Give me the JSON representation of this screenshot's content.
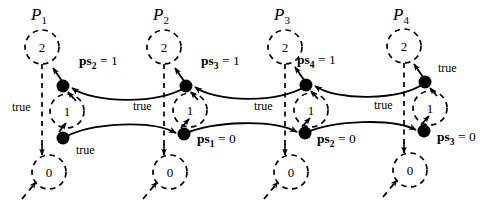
{
  "figure": {
    "kind": "timing-diagram",
    "background_color": "#ffffff",
    "ink_color": "#000000",
    "width": 487,
    "height": 205
  },
  "processes": [
    {
      "id": "p1",
      "name": "P",
      "index": "1",
      "axis_x": 42
    },
    {
      "id": "p2",
      "name": "P",
      "index": "2",
      "axis_x": 164
    },
    {
      "id": "p3",
      "name": "P",
      "index": "3",
      "axis_x": 285
    },
    {
      "id": "p4",
      "name": "P",
      "index": "4",
      "axis_x": 404
    }
  ],
  "states": {
    "top_value": "2",
    "mid_value": "1",
    "bottom_value": "0"
  },
  "state_circles": [
    {
      "id": "p1-state-2",
      "value": "2",
      "cx": 42,
      "cy": 47,
      "r": 17
    },
    {
      "id": "p1-state-1",
      "value": "1",
      "cx": 67,
      "cy": 111,
      "r": 17
    },
    {
      "id": "p1-state-0",
      "value": "0",
      "cx": 49,
      "cy": 172,
      "r": 17
    },
    {
      "id": "p2-state-2",
      "value": "2",
      "cx": 164,
      "cy": 47,
      "r": 17
    },
    {
      "id": "p2-state-1",
      "value": "1",
      "cx": 190,
      "cy": 110,
      "r": 17
    },
    {
      "id": "p2-state-0",
      "value": "0",
      "cx": 170,
      "cy": 172,
      "r": 17
    },
    {
      "id": "p3-state-2",
      "value": "2",
      "cx": 285,
      "cy": 47,
      "r": 17
    },
    {
      "id": "p3-state-1",
      "value": "1",
      "cx": 311,
      "cy": 110,
      "r": 17
    },
    {
      "id": "p3-state-0",
      "value": "0",
      "cx": 291,
      "cy": 172,
      "r": 17
    },
    {
      "id": "p4-state-2",
      "value": "2",
      "cx": 404,
      "cy": 46,
      "r": 17
    },
    {
      "id": "p4-state-1",
      "value": "1",
      "cx": 430,
      "cy": 108,
      "r": 17
    },
    {
      "id": "p4-state-0",
      "value": "0",
      "cx": 410,
      "cy": 170,
      "r": 17
    }
  ],
  "event_nodes": [
    {
      "id": "p1-upper",
      "cx": 63,
      "cy": 86,
      "r": 6.5
    },
    {
      "id": "p1-lower",
      "cx": 63,
      "cy": 138,
      "r": 6.5
    },
    {
      "id": "p2-upper",
      "cx": 186,
      "cy": 86,
      "r": 6.5
    },
    {
      "id": "p2-lower",
      "cx": 184,
      "cy": 134,
      "r": 6.5
    },
    {
      "id": "p3-upper",
      "cx": 306,
      "cy": 85,
      "r": 6.5
    },
    {
      "id": "p3-lower",
      "cx": 305,
      "cy": 133,
      "r": 6.5
    },
    {
      "id": "p4-upper",
      "cx": 425,
      "cy": 82,
      "r": 6.5
    },
    {
      "id": "p4-lower",
      "cx": 424,
      "cy": 131,
      "r": 6.5
    }
  ],
  "guards": [
    {
      "id": "guard-p1-axis",
      "text": "true",
      "x": 12,
      "y": 101
    },
    {
      "id": "guard-p1-lower",
      "text": "true",
      "x": 76,
      "y": 144
    },
    {
      "id": "guard-p2-axis",
      "text": "true",
      "x": 133,
      "y": 100
    },
    {
      "id": "guard-p3-axis",
      "text": "true",
      "x": 254,
      "y": 100
    },
    {
      "id": "guard-p4-axis",
      "text": "true",
      "x": 374,
      "y": 99
    },
    {
      "id": "guard-p4-upper",
      "text": "true",
      "x": 438,
      "y": 62
    }
  ],
  "ps_labels": [
    {
      "id": "ps2-eq-1",
      "symbol": "ps",
      "index": "2",
      "value": "1",
      "x": 79,
      "y": 61
    },
    {
      "id": "ps3-eq-1",
      "symbol": "ps",
      "index": "3",
      "value": "1",
      "x": 201,
      "y": 61
    },
    {
      "id": "ps4-eq-1",
      "symbol": "ps",
      "index": "4",
      "value": "1",
      "x": 297,
      "y": 60
    },
    {
      "id": "ps1-eq-0",
      "symbol": "ps",
      "index": "1",
      "value": "0",
      "x": 197,
      "y": 139
    },
    {
      "id": "ps2-eq-0",
      "symbol": "ps",
      "index": "2",
      "value": "0",
      "x": 317,
      "y": 139
    },
    {
      "id": "ps3-eq-0",
      "symbol": "ps",
      "index": "3",
      "value": "0",
      "x": 437,
      "y": 137
    }
  ],
  "equals_sign": "="
}
